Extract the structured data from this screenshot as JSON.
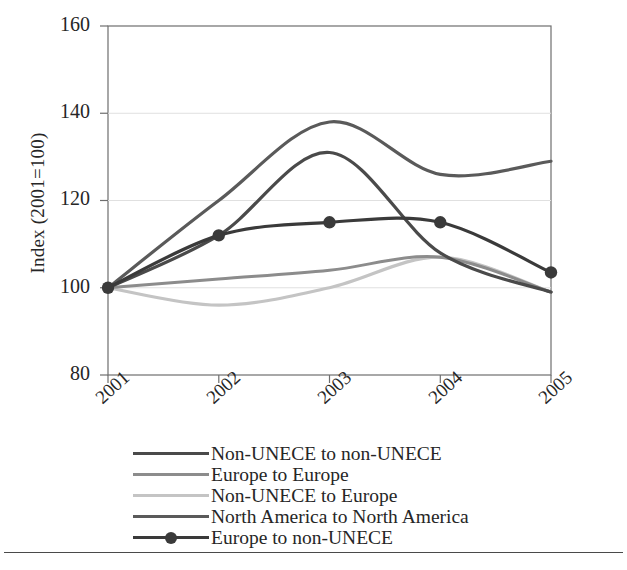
{
  "chart_data": {
    "type": "line",
    "title": "",
    "xlabel": "",
    "ylabel": "Index (2001=100)",
    "categories": [
      "2001",
      "2002",
      "2003",
      "2004",
      "2005"
    ],
    "x": [
      2001,
      2002,
      2003,
      2004,
      2005
    ],
    "ylim": [
      80,
      160
    ],
    "yticks": [
      80,
      100,
      120,
      140,
      160
    ],
    "xticks": [
      "2001",
      "2002",
      "2003",
      "2004",
      "2005"
    ],
    "grid": "horizontal",
    "legend_position": "below-axes",
    "series": [
      {
        "name": "Non-UNECE to non-UNECE",
        "color": "#4a4a4a",
        "marker": "none",
        "values": [
          100,
          112,
          131,
          108,
          99
        ]
      },
      {
        "name": "Europe to Europe",
        "color": "#8c8c8c",
        "marker": "none",
        "values": [
          100,
          102,
          104,
          107,
          99
        ]
      },
      {
        "name": "Non-UNECE to Europe",
        "color": "#c4c4c4",
        "marker": "none",
        "values": [
          100,
          96,
          100,
          107,
          99
        ]
      },
      {
        "name": "North America to North America",
        "color": "#5a5a5a",
        "marker": "none",
        "values": [
          100,
          120,
          138,
          126,
          129
        ]
      },
      {
        "name": "Europe to non-UNECE",
        "color": "#3a3a3a",
        "marker": "circle",
        "values": [
          100,
          112,
          115,
          115,
          103.5
        ]
      }
    ]
  },
  "axes": {
    "y_title": "Index (2001=100)",
    "y_labels": [
      "160",
      "140",
      "120",
      "100",
      "80"
    ],
    "x_labels": [
      "2001",
      "2002",
      "2003",
      "2004",
      "2005"
    ]
  },
  "legend": {
    "items": [
      {
        "label": "Non-UNECE to non-UNECE",
        "color": "#4a4a4a",
        "marker": "none"
      },
      {
        "label": "Europe to Europe",
        "color": "#8c8c8c",
        "marker": "none"
      },
      {
        "label": "Non-UNECE to Europe",
        "color": "#c4c4c4",
        "marker": "none"
      },
      {
        "label": "North America to North America",
        "color": "#5a5a5a",
        "marker": "none"
      },
      {
        "label": "Europe to non-UNECE",
        "color": "#3a3a3a",
        "marker": "circle"
      }
    ]
  },
  "colors": {
    "plot_border": "#6e6e6e",
    "gridline": "#d8d8d8",
    "text": "#262626",
    "rule": "#4a4a4a"
  }
}
